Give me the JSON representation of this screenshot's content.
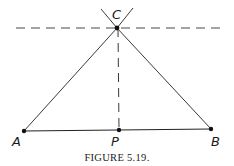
{
  "figure": {
    "caption": "FIGURE 5.19.",
    "points": {
      "A": {
        "label": "A"
      },
      "B": {
        "label": "B"
      },
      "C": {
        "label": "C"
      },
      "P": {
        "label": "P"
      }
    },
    "colors": {
      "ink": "#1a1a1a",
      "background": "#ffffff"
    }
  }
}
